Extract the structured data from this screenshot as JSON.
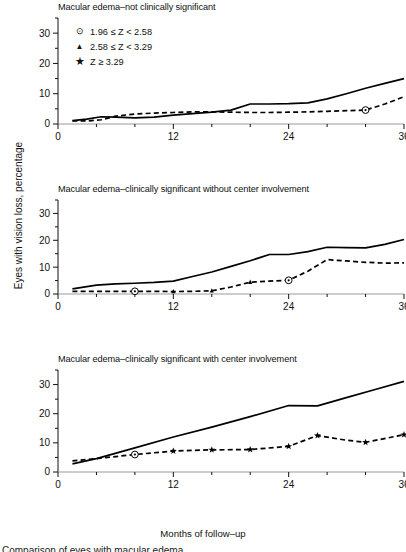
{
  "figure": {
    "xlabel": "Months of follow–up",
    "ylabel": "Eyes with vision loss, percentage",
    "caption_fragment": "Comparison of eyes with macular edema"
  },
  "legend": {
    "position": "top-left of first panel",
    "items": [
      {
        "marker": "circled-dot-icon",
        "glyph": "⊙",
        "label": "1.96 ≤ Z < 2.58"
      },
      {
        "marker": "triangle-icon",
        "glyph": "▲",
        "label": "2.58 ≤ Z < 3.29"
      },
      {
        "marker": "star-icon",
        "glyph": "★",
        "label": "Z ≥ 3.29"
      }
    ]
  },
  "axes": {
    "x_ticks_major": [
      0,
      12,
      24,
      36
    ],
    "x_ticks_minor": [
      4,
      8,
      16,
      20,
      28,
      32
    ],
    "y_ticks_major": [
      0,
      10,
      20,
      30
    ],
    "y_ticks_minor": [
      5,
      15,
      25,
      35
    ],
    "xlim": [
      0,
      36
    ],
    "ylim": [
      0,
      35
    ]
  },
  "chart_data": [
    {
      "type": "line",
      "title": "Macular edema–not clinically significant",
      "xlabel": "Months of follow–up",
      "ylabel": "Eyes with vision loss, percentage",
      "xlim": [
        0,
        36
      ],
      "ylim": [
        0,
        35
      ],
      "grid": false,
      "series": [
        {
          "name": "solid",
          "style": "solid",
          "x": [
            1.5,
            3,
            4.5,
            6,
            8,
            10,
            12,
            14,
            16,
            18,
            20,
            22,
            24,
            26,
            28,
            30,
            32,
            34,
            36
          ],
          "values": [
            1.1,
            1.6,
            2.4,
            2.3,
            2.0,
            2.3,
            2.9,
            3.4,
            3.9,
            4.6,
            6.6,
            6.6,
            6.7,
            7.0,
            8.3,
            10.0,
            11.8,
            13.4,
            15.0
          ]
        },
        {
          "name": "dashed",
          "style": "dashed",
          "x": [
            1.5,
            3,
            4.5,
            6,
            8,
            10,
            12,
            14,
            16,
            18,
            20,
            22,
            24,
            26,
            28,
            30,
            32,
            34,
            36
          ],
          "values": [
            1.0,
            1.0,
            1.4,
            2.6,
            3.3,
            3.6,
            3.8,
            4.0,
            4.0,
            3.9,
            3.8,
            3.8,
            3.9,
            4.0,
            4.2,
            4.4,
            4.6,
            6.6,
            9.0
          ],
          "markers": [
            {
              "x": 32,
              "y": 4.6,
              "type": "circled-dot-icon",
              "significance": "1.96 ≤ Z < 2.58"
            }
          ]
        }
      ]
    },
    {
      "type": "line",
      "title": "Macular edema–clinically significant without center involvement",
      "xlabel": "Months of follow–up",
      "ylabel": "Eyes with vision loss, percentage",
      "xlim": [
        0,
        36
      ],
      "ylim": [
        0,
        35
      ],
      "grid": false,
      "series": [
        {
          "name": "solid",
          "style": "solid",
          "x": [
            1.5,
            4,
            6,
            8,
            10,
            12,
            14,
            16,
            18,
            20,
            22,
            24,
            26,
            28,
            30,
            32,
            34,
            36
          ],
          "values": [
            1.9,
            3.3,
            3.8,
            4.0,
            4.3,
            4.8,
            6.5,
            8.2,
            10.3,
            12.4,
            14.7,
            14.7,
            15.8,
            17.4,
            17.3,
            17.2,
            18.5,
            20.3
          ]
        },
        {
          "name": "dashed",
          "style": "dashed",
          "x": [
            1.5,
            4,
            8,
            10,
            12,
            14,
            16,
            18,
            20,
            22,
            24,
            26,
            28,
            30,
            32,
            34,
            36
          ],
          "values": [
            1.0,
            1.0,
            1.0,
            1.0,
            0.9,
            1.0,
            1.2,
            2.6,
            4.4,
            4.8,
            5.1,
            8.5,
            12.8,
            12.3,
            11.8,
            11.5,
            11.6
          ],
          "markers": [
            {
              "x": 8,
              "y": 1.0,
              "type": "circled-dot-icon",
              "significance": "1.96 ≤ Z < 2.58"
            },
            {
              "x": 12,
              "y": 0.9,
              "type": "triangle-icon",
              "significance": "2.58 ≤ Z < 3.29"
            },
            {
              "x": 16,
              "y": 1.2,
              "type": "triangle-icon",
              "significance": "2.58 ≤ Z < 3.29"
            },
            {
              "x": 20,
              "y": 4.4,
              "type": "triangle-icon",
              "significance": "2.58 ≤ Z < 3.29"
            },
            {
              "x": 24,
              "y": 5.1,
              "type": "circled-dot-icon",
              "significance": "1.96 ≤ Z < 2.58"
            }
          ]
        }
      ]
    },
    {
      "type": "line",
      "title": "Macular edema–clinically significant with center involvement",
      "xlabel": "Months of follow–up",
      "ylabel": "Eyes with vision loss, percentage",
      "xlim": [
        0,
        36
      ],
      "ylim": [
        0,
        35
      ],
      "grid": false,
      "series": [
        {
          "name": "solid",
          "style": "solid",
          "x": [
            1.5,
            4,
            8,
            12,
            16,
            20,
            24,
            27,
            30,
            33,
            36
          ],
          "values": [
            2.8,
            4.6,
            8.3,
            12.0,
            15.4,
            19.0,
            22.8,
            22.7,
            25.5,
            28.3,
            31.1
          ]
        },
        {
          "name": "dashed",
          "style": "dashed",
          "x": [
            1.5,
            4,
            8,
            12,
            16,
            20,
            24,
            27,
            30,
            32,
            36
          ],
          "values": [
            3.8,
            4.6,
            6.0,
            7.2,
            7.6,
            7.7,
            8.8,
            12.5,
            10.9,
            10.2,
            12.8
          ],
          "markers": [
            {
              "x": 8,
              "y": 6.0,
              "type": "circled-dot-icon",
              "significance": "1.96 ≤ Z < 2.58"
            },
            {
              "x": 12,
              "y": 7.2,
              "type": "star-icon",
              "significance": "Z ≥ 3.29"
            },
            {
              "x": 16,
              "y": 7.6,
              "type": "star-icon",
              "significance": "Z ≥ 3.29"
            },
            {
              "x": 20,
              "y": 7.7,
              "type": "star-icon",
              "significance": "Z ≥ 3.29"
            },
            {
              "x": 24,
              "y": 8.8,
              "type": "star-icon",
              "significance": "Z ≥ 3.29"
            },
            {
              "x": 27,
              "y": 12.5,
              "type": "star-icon",
              "significance": "Z ≥ 3.29"
            },
            {
              "x": 32,
              "y": 10.2,
              "type": "star-icon",
              "significance": "Z ≥ 3.29"
            },
            {
              "x": 36,
              "y": 12.8,
              "type": "star-icon",
              "significance": "Z ≥ 3.29"
            }
          ]
        }
      ]
    }
  ]
}
